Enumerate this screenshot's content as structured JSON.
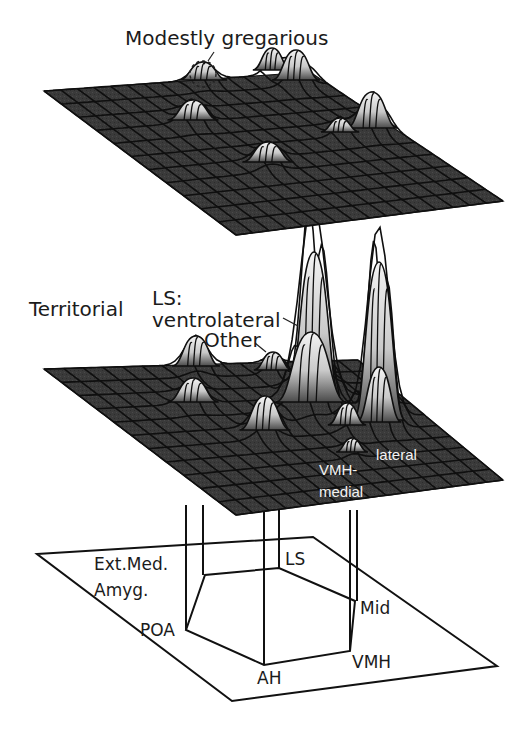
{
  "figure": {
    "colors": {
      "background": "#ffffff",
      "surface": "#3a3a3a",
      "grid_line": "#0f0f0f",
      "peak_light": "#ececec",
      "wireframe": "#111111",
      "label_dark": "#1b1b1b",
      "label_light": "#f2f2f2"
    },
    "top_panel": {
      "label": "Modestly gregarious",
      "annotation": "dashed circle highlights a single small peak",
      "plane": {
        "left": [
          44,
          91
        ],
        "far": [
          310,
          72
        ],
        "right": [
          503,
          201
        ],
        "near": [
          236,
          235
        ]
      },
      "grid": {
        "rows": 11,
        "cols": 16
      },
      "peaks": [
        {
          "x": 203,
          "y": 80,
          "h": 18,
          "w": 15
        },
        {
          "x": 272,
          "y": 70,
          "h": 22,
          "w": 12
        },
        {
          "x": 296,
          "y": 80,
          "h": 30,
          "w": 15
        },
        {
          "x": 193,
          "y": 120,
          "h": 20,
          "w": 16
        },
        {
          "x": 340,
          "y": 132,
          "h": 14,
          "w": 12
        },
        {
          "x": 372,
          "y": 128,
          "h": 36,
          "w": 16
        },
        {
          "x": 268,
          "y": 162,
          "h": 20,
          "w": 16
        }
      ]
    },
    "middle_panel": {
      "label": "Territorial",
      "callouts": [
        {
          "text_lines": [
            "LS:",
            "ventrolateral"
          ],
          "target": "tall left peak"
        },
        {
          "text_lines": [
            "Other"
          ],
          "target": "small peak left of ventrolateral"
        }
      ],
      "inline_labels": [
        {
          "text": "lateral"
        },
        {
          "text_lines": [
            "VMH-",
            "medial"
          ]
        }
      ],
      "plane": {
        "left": [
          44,
          369
        ],
        "far": [
          358,
          360
        ],
        "right": [
          503,
          480
        ],
        "near": [
          236,
          515
        ]
      },
      "grid": {
        "rows": 11,
        "cols": 16
      },
      "peaks": [
        {
          "x": 196,
          "y": 366,
          "h": 30,
          "w": 15
        },
        {
          "x": 273,
          "y": 370,
          "h": 18,
          "w": 12
        },
        {
          "x": 314,
          "y": 400,
          "h": 148,
          "w": 17
        },
        {
          "x": 311,
          "y": 402,
          "h": 70,
          "w": 22
        },
        {
          "x": 379,
          "y": 420,
          "h": 158,
          "w": 16
        },
        {
          "x": 379,
          "y": 422,
          "h": 55,
          "w": 14
        },
        {
          "x": 193,
          "y": 402,
          "h": 24,
          "w": 16
        },
        {
          "x": 265,
          "y": 430,
          "h": 34,
          "w": 16
        },
        {
          "x": 347,
          "y": 425,
          "h": 22,
          "w": 12
        },
        {
          "x": 352,
          "y": 452,
          "h": 14,
          "w": 10
        }
      ]
    },
    "bottom_panel": {
      "plane": {
        "left": [
          37,
          554
        ],
        "far": [
          313,
          537
        ],
        "right": [
          497,
          666
        ],
        "near": [
          232,
          701
        ]
      },
      "regions": [
        {
          "id": "LS",
          "label": "LS",
          "pos": [
            279,
            568
          ]
        },
        {
          "id": "Mid",
          "label": "Mid",
          "pos": [
            355,
            601
          ]
        },
        {
          "id": "VMH",
          "label": "VMH",
          "pos": [
            350,
            651
          ]
        },
        {
          "id": "AH",
          "label": "AH",
          "pos": [
            264,
            665
          ]
        },
        {
          "id": "POA",
          "label": "POA",
          "pos": [
            186,
            630
          ]
        },
        {
          "id": "ExtMedAmyg",
          "label_lines": [
            "Ext.Med.",
            "Amyg."
          ],
          "pos": [
            205,
            575
          ]
        }
      ],
      "vertical_connectors_x": [
        186,
        203,
        264,
        279,
        350,
        357
      ]
    }
  },
  "labels": {
    "modestly_gregarious": "Modestly gregarious",
    "territorial": "Territorial",
    "ls_prefix": "LS:",
    "ventrolateral": "ventrolateral",
    "other": "Other",
    "lateral": "lateral",
    "vmh_dash": "VMH-",
    "medial": "medial",
    "ext_med": "Ext.Med.",
    "amyg": "Amyg.",
    "ls": "LS",
    "mid": "Mid",
    "poa": "POA",
    "vmh": "VMH",
    "ah": "AH"
  }
}
